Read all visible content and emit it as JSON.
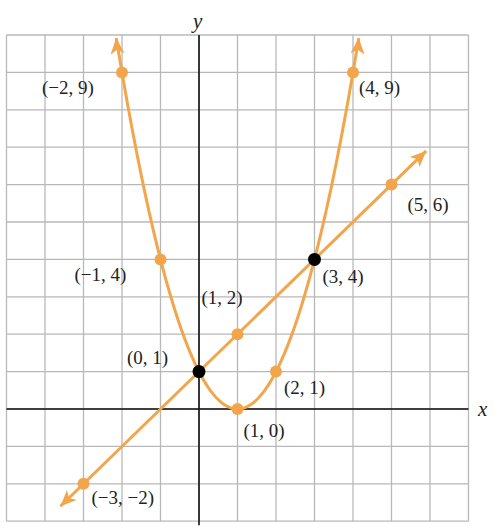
{
  "chart_data": {
    "type": "line",
    "title": "",
    "xlabel": "x",
    "ylabel": "y",
    "xlim": [
      -5,
      7
    ],
    "ylim": [
      -3,
      10
    ],
    "grid": true,
    "colors": {
      "curve": "#f2a54a",
      "intersection": "#000000",
      "grid": "#b8b8b8",
      "axis": "#111111"
    },
    "series": [
      {
        "name": "parabola",
        "equation": "y = (x - 1)^2",
        "points": [
          {
            "x": -2,
            "y": 9,
            "label": "(−2, 9)"
          },
          {
            "x": -1,
            "y": 4,
            "label": "(−1, 4)"
          },
          {
            "x": 0,
            "y": 1,
            "label": "(0, 1)"
          },
          {
            "x": 1,
            "y": 0,
            "label": "(1, 0)"
          },
          {
            "x": 2,
            "y": 1,
            "label": "(2, 1)"
          },
          {
            "x": 3,
            "y": 4,
            "label": "(3, 4)"
          },
          {
            "x": 4,
            "y": 9,
            "label": "(4, 9)"
          }
        ]
      },
      {
        "name": "line",
        "equation": "y = x + 1",
        "points": [
          {
            "x": -3,
            "y": -2,
            "label": "(−3, −2)"
          },
          {
            "x": 0,
            "y": 1,
            "label": "(0, 1)"
          },
          {
            "x": 1,
            "y": 2,
            "label": "(1, 2)"
          },
          {
            "x": 3,
            "y": 4,
            "label": "(3, 4)"
          },
          {
            "x": 5,
            "y": 6,
            "label": "(5, 6)"
          }
        ]
      }
    ],
    "intersections": [
      {
        "x": 0,
        "y": 1,
        "label": "(0, 1)"
      },
      {
        "x": 3,
        "y": 4,
        "label": "(3, 4)"
      }
    ],
    "annotations": [
      {
        "text": "(−2, 9)",
        "x": -2,
        "y": 9
      },
      {
        "text": "(4, 9)",
        "x": 4,
        "y": 9
      },
      {
        "text": "(5, 6)",
        "x": 5,
        "y": 6
      },
      {
        "text": "(−1, 4)",
        "x": -1,
        "y": 4
      },
      {
        "text": "(3, 4)",
        "x": 3,
        "y": 4
      },
      {
        "text": "(1, 2)",
        "x": 1,
        "y": 2
      },
      {
        "text": "(0, 1)",
        "x": 0,
        "y": 1
      },
      {
        "text": "(2, 1)",
        "x": 2,
        "y": 1
      },
      {
        "text": "(1, 0)",
        "x": 1,
        "y": 0
      },
      {
        "text": "(−3, −2)",
        "x": -3,
        "y": -2
      }
    ]
  }
}
